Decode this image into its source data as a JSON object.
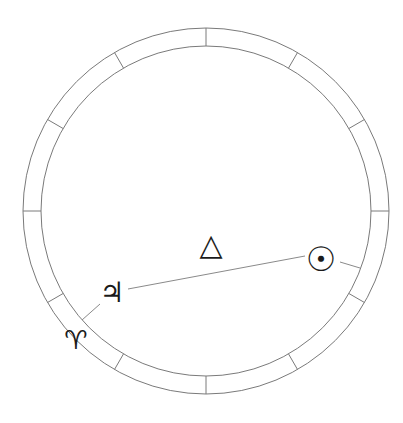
{
  "diagram": {
    "type": "astrological-chart-wheel",
    "center": [
      206,
      211
    ],
    "outer_radius": 183,
    "inner_radius": 165,
    "divisions": 12,
    "stroke_color": "#7a7a7a",
    "ink_color": "#1a1a1a"
  },
  "planets": [
    {
      "name": "Sun",
      "glyph": "☉",
      "x": 321,
      "y": 259
    },
    {
      "name": "Jupiter",
      "glyph": "♃",
      "x": 112,
      "y": 293
    }
  ],
  "aspect": {
    "name": "Trine",
    "glyph": "△",
    "x": 211,
    "y": 245
  },
  "sign_markers": [
    {
      "name": "Aries",
      "glyph": "♈",
      "x": 76,
      "y": 340
    }
  ]
}
